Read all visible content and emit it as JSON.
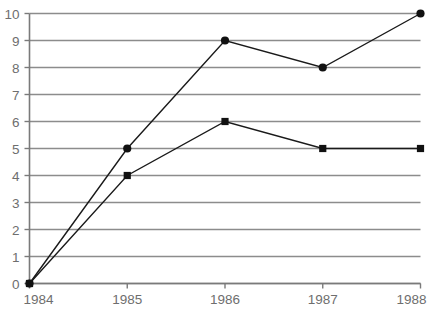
{
  "chart_data": {
    "type": "line",
    "title": "",
    "subtitle": "",
    "xlabel": "",
    "ylabel": "",
    "categories": [
      "1984",
      "1985",
      "1986",
      "1987",
      "1988"
    ],
    "x": [
      1984,
      1985,
      1986,
      1987,
      1988
    ],
    "xlim": [
      1984,
      1988
    ],
    "ylim": [
      0,
      10
    ],
    "y_ticks": [
      "0",
      "1",
      "2",
      "3",
      "4",
      "5",
      "6",
      "7",
      "8",
      "9",
      "10"
    ],
    "y_tick_values": [
      0,
      1,
      2,
      3,
      4,
      5,
      6,
      7,
      8,
      9,
      10
    ],
    "x_ticks": [
      "1984",
      "1985",
      "1986",
      "1987",
      "1988"
    ],
    "grid": "horizontal",
    "legend": "none",
    "annotations": [],
    "series": [
      {
        "name": "series-circle",
        "marker": "circle",
        "values": [
          0,
          5,
          9,
          8,
          10
        ]
      },
      {
        "name": "series-square",
        "marker": "square",
        "values": [
          0,
          4,
          6,
          5,
          5
        ]
      }
    ]
  },
  "style": {
    "grid_color": "#8c8c8c",
    "axis_color": "#7a7a7a",
    "tick_label_color": "#6e6e6e",
    "series_color": "#1a1a1a",
    "background": "#ffffff"
  }
}
